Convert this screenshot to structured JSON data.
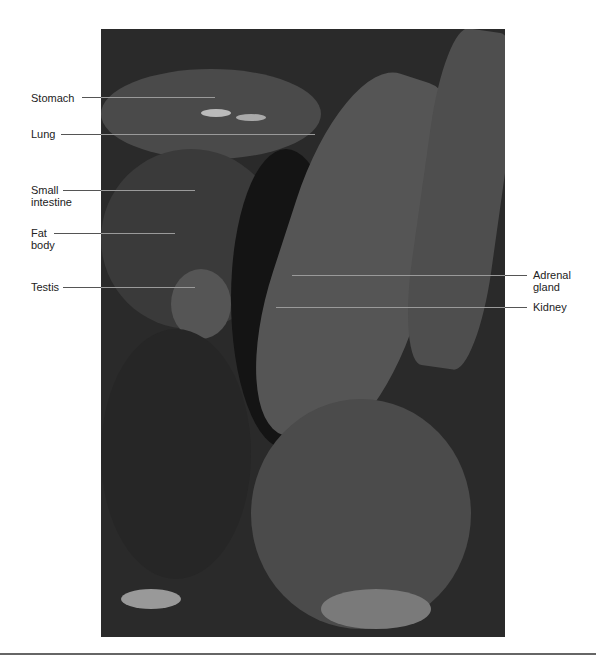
{
  "figure": {
    "type": "grayscale dissection photograph",
    "labels_left": [
      {
        "id": "stomach",
        "text": "Stomach",
        "x": 31,
        "y": 92,
        "line": {
          "x1": 82,
          "x2": 215,
          "y": 97
        }
      },
      {
        "id": "lung",
        "text": "Lung",
        "x": 31,
        "y": 128,
        "line": {
          "x1": 61,
          "x2": 315,
          "y": 134
        }
      },
      {
        "id": "small-intestine",
        "text": "Small\nintestine",
        "x": 31,
        "y": 184,
        "line": {
          "x1": 63,
          "x2": 195,
          "y": 190
        }
      },
      {
        "id": "fat-body",
        "text": "Fat\nbody",
        "x": 31,
        "y": 227,
        "line": {
          "x1": 54,
          "x2": 175,
          "y": 233
        }
      },
      {
        "id": "testis",
        "text": "Testis",
        "x": 31,
        "y": 281,
        "line": {
          "x1": 63,
          "x2": 195,
          "y": 287
        }
      }
    ],
    "labels_right": [
      {
        "id": "adrenal-gland",
        "text": "Adrenal\ngland",
        "x": 533,
        "y": 269,
        "line": {
          "x1": 292,
          "x2": 527,
          "y": 275
        }
      },
      {
        "id": "kidney",
        "text": "Kidney",
        "x": 533,
        "y": 301,
        "line": {
          "x1": 276,
          "x2": 527,
          "y": 307
        }
      }
    ]
  }
}
